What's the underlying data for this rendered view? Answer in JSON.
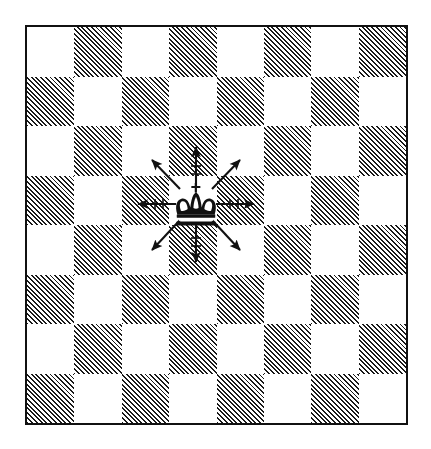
{
  "diagram": {
    "type": "chessboard",
    "caption": "",
    "colors": {
      "light_square": "#ffffff",
      "dark_square_hatch": "#1a1a1a",
      "border": "#111111",
      "piece": "#111111",
      "arrow": "#111111"
    },
    "board": {
      "files": 8,
      "ranks": 8,
      "square_size_px": 47.5,
      "top_left_square_shade": "light",
      "pattern_rule": "row+col even = light, odd = hatched",
      "rows": [
        [
          "light",
          "dark",
          "light",
          "dark",
          "light",
          "dark",
          "light",
          "dark"
        ],
        [
          "dark",
          "light",
          "dark",
          "light",
          "dark",
          "light",
          "dark",
          "light"
        ],
        [
          "light",
          "dark",
          "light",
          "dark",
          "light",
          "dark",
          "light",
          "dark"
        ],
        [
          "dark",
          "light",
          "dark",
          "light",
          "dark",
          "light",
          "dark",
          "light"
        ],
        [
          "light",
          "dark",
          "light",
          "dark",
          "light",
          "dark",
          "light",
          "dark"
        ],
        [
          "dark",
          "light",
          "dark",
          "light",
          "dark",
          "light",
          "dark",
          "light"
        ],
        [
          "light",
          "dark",
          "light",
          "dark",
          "light",
          "dark",
          "light",
          "dark"
        ],
        [
          "dark",
          "light",
          "dark",
          "light",
          "dark",
          "light",
          "dark",
          "light"
        ]
      ]
    },
    "pieces": [
      {
        "name": "king",
        "color": "black",
        "glyph": "♚",
        "row": 3,
        "col": 3,
        "square_shade": "light"
      }
    ],
    "arrows": {
      "count": 8,
      "origin": {
        "row": 3,
        "col": 3
      },
      "directions": [
        "north",
        "northeast",
        "east",
        "southeast",
        "south",
        "southwest",
        "west",
        "northwest"
      ],
      "style": "single-headed, thin shaft, solid head",
      "meaning": "king moves one square in any direction"
    }
  }
}
